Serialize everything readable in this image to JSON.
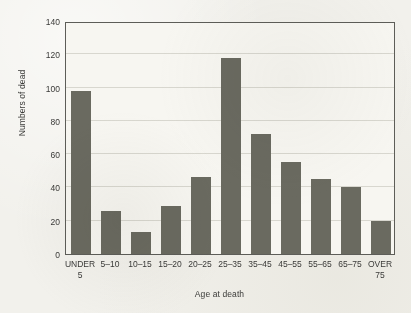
{
  "chart_data": {
    "type": "bar",
    "title": "",
    "xlabel": "Age at death",
    "ylabel": "Numbers of dead",
    "categories": [
      "UNDER 5",
      "5–10",
      "10–15",
      "15–20",
      "20–25",
      "25–35",
      "35–45",
      "45–55",
      "55–65",
      "65–75",
      "OVER 75"
    ],
    "category_lines": [
      [
        "UNDER",
        "5"
      ],
      [
        "5–10",
        ""
      ],
      [
        "10–15",
        ""
      ],
      [
        "15–20",
        ""
      ],
      [
        "20–25",
        ""
      ],
      [
        "25–35",
        ""
      ],
      [
        "35–45",
        ""
      ],
      [
        "45–55",
        ""
      ],
      [
        "55–65",
        ""
      ],
      [
        "65–75",
        ""
      ],
      [
        "OVER",
        "75"
      ]
    ],
    "values": [
      98,
      26,
      13,
      29,
      46,
      118,
      72,
      55,
      45,
      40,
      20
    ],
    "ylim": [
      0,
      140
    ],
    "yticks": [
      0,
      20,
      40,
      60,
      80,
      100,
      120,
      140
    ],
    "ytick_labels": [
      "0",
      "20",
      "40",
      "60",
      "80",
      "100",
      "120",
      "140"
    ],
    "grid": true,
    "grid_axis": "y",
    "legend": "none",
    "bar_color": "#6a6a60",
    "plot_background": "#f7f6f1",
    "figure_background": "#f2f1ec",
    "axis_color": "#5d5d58",
    "gridline_color": "#d8d7cf",
    "text_color": "#3a3a38"
  }
}
